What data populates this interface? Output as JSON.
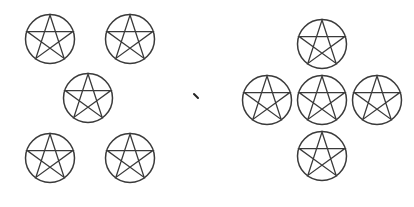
{
  "figure": {
    "stroke_color": "#3a3a3a",
    "background": "#ffffff",
    "symbol_radius": 24.5,
    "groups": [
      {
        "name": "quincunx-arrangement",
        "symbols": [
          {
            "name": "top-left",
            "cx": 50,
            "cy": 39
          },
          {
            "name": "top-right",
            "cx": 130,
            "cy": 39
          },
          {
            "name": "center",
            "cx": 88,
            "cy": 98
          },
          {
            "name": "bottom-left",
            "cx": 50,
            "cy": 158
          },
          {
            "name": "bottom-right",
            "cx": 130,
            "cy": 158
          }
        ]
      },
      {
        "name": "cross-arrangement",
        "symbols": [
          {
            "name": "top",
            "cx": 322,
            "cy": 44
          },
          {
            "name": "left",
            "cx": 267,
            "cy": 100
          },
          {
            "name": "center",
            "cx": 322,
            "cy": 100
          },
          {
            "name": "right",
            "cx": 377,
            "cy": 100
          },
          {
            "name": "bottom",
            "cx": 322,
            "cy": 156
          }
        ]
      }
    ],
    "separator_mark": {
      "x1": 194,
      "y1": 94,
      "x2": 198,
      "y2": 98
    }
  }
}
